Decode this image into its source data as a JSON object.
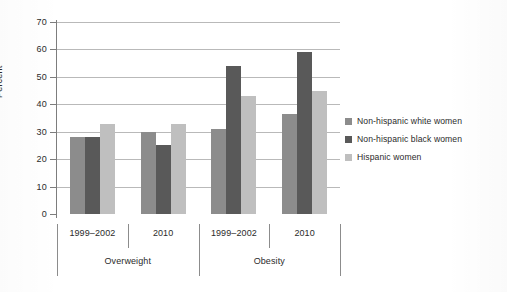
{
  "chart_data": {
    "type": "bar",
    "title": "",
    "xlabel": "",
    "ylabel": "Percent",
    "ylim": [
      0,
      70
    ],
    "yticks": [
      0,
      10,
      20,
      30,
      40,
      50,
      60,
      70
    ],
    "ytick_labels": [
      "0",
      "10",
      "20",
      "30",
      "40",
      "50",
      "60",
      "70"
    ],
    "grid": true,
    "legend_position": "right",
    "categories": [
      "1999–2002",
      "2010",
      "1999–2002",
      "2010"
    ],
    "group_labels": [
      "Overweight",
      "Obesity"
    ],
    "series": [
      {
        "name": "Non-hispanic white women",
        "color": "#8c8c8c",
        "values": [
          28,
          30,
          31,
          36.5
        ]
      },
      {
        "name": "Non-hispanic black women",
        "color": "#595959",
        "values": [
          28,
          25,
          54,
          59
        ]
      },
      {
        "name": "Hispanic women",
        "color": "#bfbfbf",
        "values": [
          33,
          33,
          43,
          45
        ]
      }
    ]
  },
  "axis": {
    "y_label": "Percent",
    "y_ticks": [
      "70",
      "60",
      "50",
      "40",
      "30",
      "20",
      "10",
      "0"
    ]
  },
  "categories": [
    {
      "label": "1999–2002"
    },
    {
      "label": "2010"
    },
    {
      "label": "1999–2002"
    },
    {
      "label": "2010"
    }
  ],
  "groups": [
    {
      "label": "Overweight"
    },
    {
      "label": "Obesity"
    }
  ],
  "legend": {
    "items": [
      {
        "label": "Non-hispanic white women",
        "color": "#8c8c8c"
      },
      {
        "label": "Non-hispanic black women",
        "color": "#595959"
      },
      {
        "label": "Hispanic women",
        "color": "#bfbfbf"
      }
    ]
  }
}
